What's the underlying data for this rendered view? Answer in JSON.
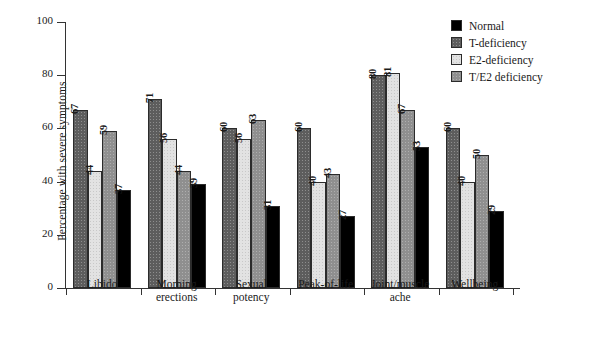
{
  "chart_data": {
    "type": "bar",
    "title": "",
    "xlabel": "",
    "ylabel": "Percentage with severe symptoms",
    "ylim": [
      0,
      100
    ],
    "yticks": [
      0,
      20,
      40,
      60,
      80,
      100
    ],
    "grid": false,
    "legend_position": "top-right",
    "categories": [
      "Libido",
      "Morning erections",
      "Sexual potency",
      "Peak-of-life",
      "Joint/muscle ache",
      "Wellbeing"
    ],
    "category_lines": [
      [
        "Libido"
      ],
      [
        "Morning",
        "erections"
      ],
      [
        "Sexual",
        "potency"
      ],
      [
        "Peak-of-life"
      ],
      [
        "Joint/muscle",
        "ache"
      ],
      [
        "Wellbeing"
      ]
    ],
    "series": [
      {
        "name": "T-deficiency",
        "color": "#5d5d5d",
        "values": [
          67,
          71,
          60,
          60,
          80,
          60
        ]
      },
      {
        "name": "E2-deficiency",
        "color": "#e2e2e2",
        "values": [
          44,
          56,
          56,
          40,
          81,
          40
        ]
      },
      {
        "name": "T/E2 deficiency",
        "color": "#8f8f8f",
        "values": [
          59,
          44,
          63,
          43,
          67,
          50
        ]
      },
      {
        "name": "Normal",
        "color": "#000000",
        "values": [
          37,
          39,
          31,
          27,
          53,
          29
        ]
      }
    ]
  },
  "legend": {
    "entries": [
      {
        "label": "Normal",
        "color": "#000000",
        "fill": "fill-normal"
      },
      {
        "label": "T-deficiency",
        "color": "#5d5d5d",
        "fill": "fill-t"
      },
      {
        "label": "E2-deficiency",
        "color": "#e2e2e2",
        "fill": "fill-e2"
      },
      {
        "label": "T/E2 deficiency",
        "color": "#8f8f8f",
        "fill": "fill-te2"
      }
    ]
  },
  "axis": {
    "y_title": "Percentage with severe symptoms",
    "y_tick_labels": [
      "100",
      "80",
      "60",
      "40",
      "20",
      "0"
    ]
  }
}
